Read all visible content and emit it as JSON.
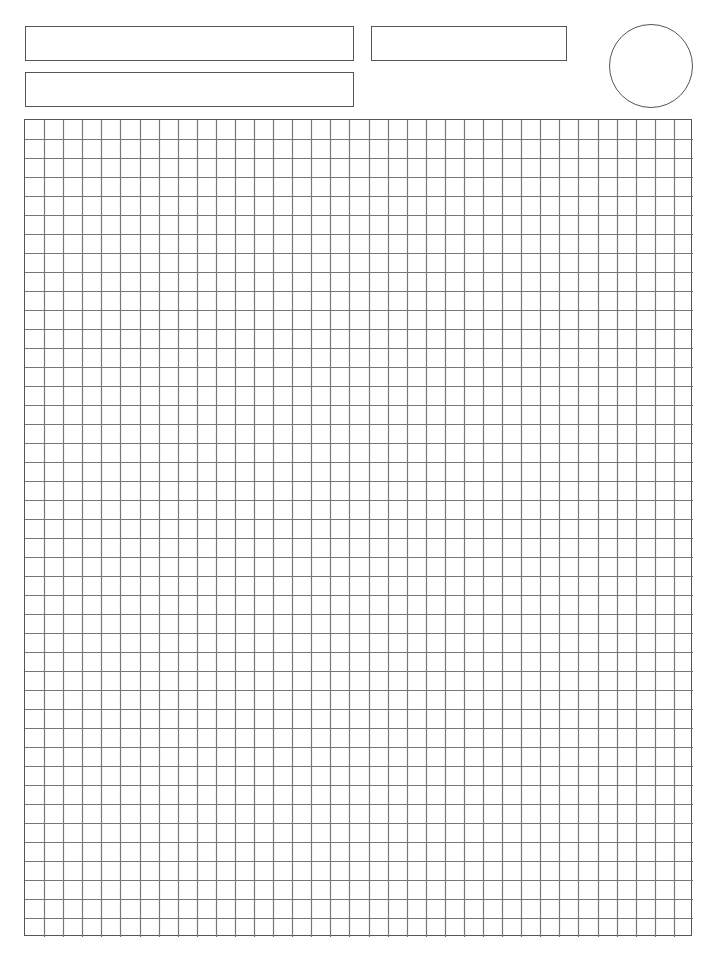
{
  "page": {
    "background": "#ffffff",
    "line_color": "#555555",
    "grid_line_color": "#777777"
  },
  "header": {
    "fields": [
      {
        "name": "field-1",
        "x": 25,
        "y": 26,
        "w": 329,
        "h": 35,
        "value": ""
      },
      {
        "name": "field-2",
        "x": 25,
        "y": 72,
        "w": 329,
        "h": 35,
        "value": ""
      },
      {
        "name": "field-3",
        "x": 371,
        "y": 26,
        "w": 196,
        "h": 35,
        "value": ""
      }
    ],
    "circle": {
      "cx": 651,
      "cy": 66,
      "r": 42
    }
  },
  "grid": {
    "x": 24,
    "y": 119,
    "width": 668,
    "height": 817,
    "columns": 35,
    "rows": 43
  }
}
